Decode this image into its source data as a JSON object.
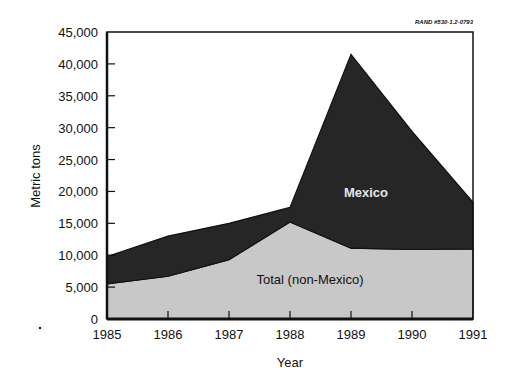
{
  "chart_data": {
    "type": "area",
    "stacked": true,
    "title": "",
    "source_note": "RAND #530-1.2-0793",
    "xlabel": "Year",
    "ylabel": "Metric tons",
    "x": [
      "1985",
      "1986",
      "1987",
      "1988",
      "1989",
      "1990",
      "1991"
    ],
    "ylim": [
      0,
      45000
    ],
    "yticks": [
      0,
      5000,
      10000,
      15000,
      20000,
      25000,
      30000,
      35000,
      40000,
      45000
    ],
    "ytick_labels": [
      "0",
      "5,000",
      "10,000",
      "15,000",
      "20,000",
      "25,000",
      "30,000",
      "35,000",
      "40,000",
      "45,000"
    ],
    "grid": false,
    "legend": "inline labels",
    "series": [
      {
        "name": "Total (non-Mexico)",
        "color": "#c8c8c8",
        "label_color": "#111111",
        "values": [
          5500,
          6700,
          9300,
          15200,
          11100,
          10900,
          11000
        ]
      },
      {
        "name": "Mexico",
        "color": "#262626",
        "label_color": "#e6e6e6",
        "values": [
          4300,
          6300,
          5700,
          2300,
          30400,
          18500,
          7300
        ]
      }
    ],
    "totals": [
      9800,
      13000,
      15000,
      17500,
      41500,
      29400,
      18300
    ]
  }
}
